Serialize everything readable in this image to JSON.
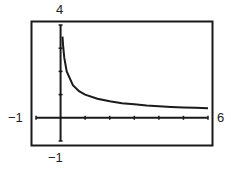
{
  "chart_data": {
    "type": "line",
    "title": "",
    "function": "y = 1/sqrt(x)",
    "xlabel": "",
    "ylabel": "",
    "xlim": [
      -1,
      6
    ],
    "ylim": [
      -1,
      4
    ],
    "x_tick_step": 1,
    "y_tick_step": 1,
    "grid": false,
    "legend": "none",
    "window_labels": {
      "ymax": "4",
      "ymin": "−1",
      "xmin": "−1",
      "xmax": "6"
    },
    "series": [
      {
        "name": "y = 1/√x",
        "x": [
          0.08,
          0.1,
          0.15,
          0.25,
          0.5,
          0.75,
          1,
          1.5,
          2,
          2.5,
          3,
          3.5,
          4,
          4.5,
          5,
          5.5,
          6
        ],
        "y": [
          3.5,
          3.16,
          2.58,
          2.0,
          1.41,
          1.15,
          1.0,
          0.82,
          0.71,
          0.63,
          0.58,
          0.53,
          0.5,
          0.47,
          0.45,
          0.43,
          0.41
        ]
      }
    ]
  },
  "colors": {
    "ink": "#1a1a1a",
    "background": "#ffffff"
  }
}
